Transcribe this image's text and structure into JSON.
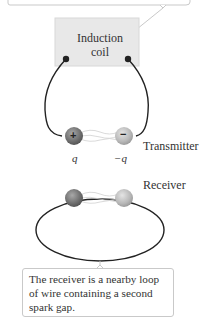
{
  "diagram": {
    "top_callout": {
      "text": ""
    },
    "induction_coil": {
      "label": "Induction\ncoil",
      "line1": "Induction",
      "line2": "coil"
    },
    "transmitter": {
      "label": "Transmitter",
      "positive_sphere": {
        "sign": "+",
        "charge": "q"
      },
      "negative_sphere": {
        "sign": "−",
        "charge": "−q"
      }
    },
    "receiver": {
      "label": "Receiver"
    },
    "bottom_callout": {
      "text": "The receiver is a nearby loop of wire containing a second spark gap."
    },
    "colors": {
      "coil_box": "#e8e8e8",
      "callout_border": "#c9c9c9",
      "wire": "#222222",
      "positive_sphere": "#8a8a8a",
      "negative_sphere": "#c8c8c8"
    }
  }
}
